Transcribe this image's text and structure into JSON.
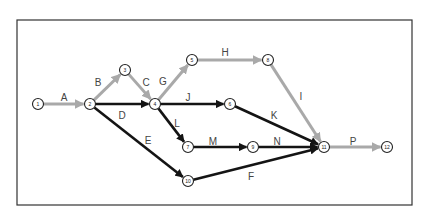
{
  "diagram": {
    "type": "activity-on-arrow network",
    "colors": {
      "critical": "#a9a9a9",
      "normal": "#141414",
      "frame": "#333333"
    },
    "nodes": [
      {
        "id": "1",
        "x": 38,
        "y": 104
      },
      {
        "id": "2",
        "x": 90,
        "y": 104
      },
      {
        "id": "3",
        "x": 125,
        "y": 70
      },
      {
        "id": "4",
        "x": 155,
        "y": 104
      },
      {
        "id": "5",
        "x": 192,
        "y": 60
      },
      {
        "id": "6",
        "x": 230,
        "y": 104
      },
      {
        "id": "7",
        "x": 188,
        "y": 147
      },
      {
        "id": "8",
        "x": 268,
        "y": 60
      },
      {
        "id": "9",
        "x": 253,
        "y": 147
      },
      {
        "id": "10",
        "x": 188,
        "y": 181
      },
      {
        "id": "11",
        "x": 324,
        "y": 147
      },
      {
        "id": "12",
        "x": 387,
        "y": 147
      }
    ],
    "edges": [
      {
        "label": "A",
        "from": "1",
        "to": "2",
        "style": "critical",
        "lx": 64,
        "ly": 97
      },
      {
        "label": "B",
        "from": "2",
        "to": "3",
        "style": "critical",
        "lx": 98,
        "ly": 82
      },
      {
        "label": "C",
        "from": "3",
        "to": "4",
        "style": "critical",
        "lx": 146,
        "ly": 82
      },
      {
        "label": "D",
        "from": "2",
        "to": "4",
        "style": "normal",
        "lx": 122,
        "ly": 115
      },
      {
        "label": "E",
        "from": "2",
        "to": "10",
        "style": "normal",
        "lx": 148,
        "ly": 140
      },
      {
        "label": "G",
        "from": "4",
        "to": "5",
        "style": "critical",
        "lx": 163,
        "ly": 81
      },
      {
        "label": "H",
        "from": "5",
        "to": "8",
        "style": "critical",
        "lx": 225,
        "ly": 52
      },
      {
        "label": "I",
        "from": "8",
        "to": "11",
        "style": "critical",
        "lx": 301,
        "ly": 96
      },
      {
        "label": "J",
        "from": "4",
        "to": "6",
        "style": "normal",
        "lx": 188,
        "ly": 97
      },
      {
        "label": "K",
        "from": "6",
        "to": "11",
        "style": "normal",
        "lx": 274,
        "ly": 115
      },
      {
        "label": "L",
        "from": "4",
        "to": "7",
        "style": "normal",
        "lx": 177,
        "ly": 123
      },
      {
        "label": "M",
        "from": "7",
        "to": "9",
        "style": "normal",
        "lx": 213,
        "ly": 141
      },
      {
        "label": "N",
        "from": "9",
        "to": "11",
        "style": "normal",
        "lx": 277,
        "ly": 141
      },
      {
        "label": "F",
        "from": "10",
        "to": "11",
        "style": "normal",
        "lx": 251,
        "ly": 176
      },
      {
        "label": "P",
        "from": "11",
        "to": "12",
        "style": "critical",
        "lx": 353,
        "ly": 141
      }
    ],
    "frame": {
      "x": 17,
      "y": 20,
      "w": 395,
      "h": 185
    }
  }
}
